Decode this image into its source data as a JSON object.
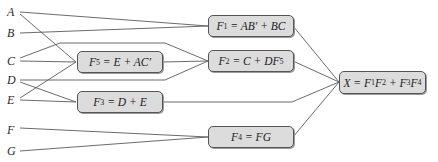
{
  "inputs": [
    {
      "id": "A",
      "label": "A"
    },
    {
      "id": "B",
      "label": "B"
    },
    {
      "id": "C",
      "label": "C"
    },
    {
      "id": "D",
      "label": "D"
    },
    {
      "id": "E",
      "label": "E"
    },
    {
      "id": "F",
      "label": "F"
    },
    {
      "id": "G",
      "label": "G"
    }
  ],
  "blocks": {
    "f1": {
      "lhs": "F",
      "lhs_sub": "1",
      "rhs": " = AB′ + BC",
      "inputs": [
        "A",
        "B",
        "C"
      ]
    },
    "f2": {
      "lhs": "F",
      "lhs_sub": "2",
      "rhs_pre": " = C + DF",
      "rhs_sub": "5",
      "inputs": [
        "C",
        "F5",
        "D"
      ]
    },
    "f3": {
      "lhs": "F",
      "lhs_sub": "3",
      "rhs": " = D + E",
      "inputs": [
        "D",
        "E"
      ]
    },
    "f4": {
      "lhs": "F",
      "lhs_sub": "4",
      "rhs": " = FG",
      "inputs": [
        "F",
        "G"
      ]
    },
    "f5": {
      "lhs": "F",
      "lhs_sub": "5",
      "rhs": " = E + AC′",
      "inputs": [
        "A",
        "C",
        "E"
      ]
    },
    "x": {
      "lhs": "X = F",
      "s1": "1",
      "m1": "F",
      "s2": "2",
      "m2": " + F",
      "s3": "3",
      "m3": "F",
      "s4": "4",
      "inputs": [
        "F1",
        "F2",
        "F3",
        "F4"
      ]
    }
  }
}
